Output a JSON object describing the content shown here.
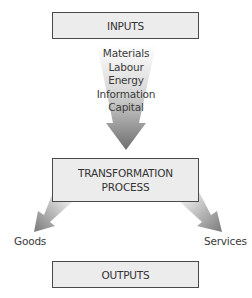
{
  "diagram": {
    "inputs_box": {
      "label": "INPUTS"
    },
    "input_items": [
      "Materials",
      "Labour",
      "Energy",
      "Information",
      "Capital"
    ],
    "transformation_box": {
      "line1": "TRANSFORMATION",
      "line2": "PROCESS"
    },
    "outputs": {
      "left": "Goods",
      "right": "Services"
    },
    "outputs_box": {
      "label": "OUTPUTS"
    },
    "colors": {
      "box_fill": "#ececec",
      "box_border": "#4a4a4a",
      "arrow_dark": "#7a7a7a",
      "arrow_light": "#f2f2f2"
    }
  }
}
